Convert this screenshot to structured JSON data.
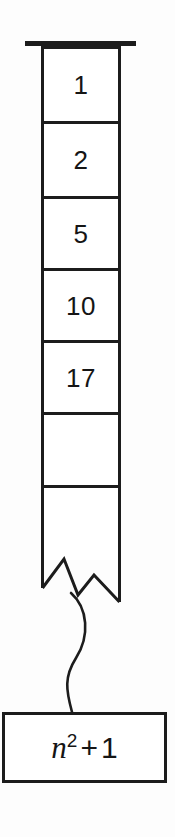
{
  "diagram": {
    "type": "array-cell-diagram",
    "background_color": "#fdfdfd",
    "line_color": "#1c1c1c",
    "text_color": "#151515"
  },
  "array": {
    "name": "vertical-array",
    "cell_count": 7,
    "truncated": true,
    "top_cap": true,
    "cells": [
      {
        "index": 0,
        "value": "1",
        "empty": false
      },
      {
        "index": 1,
        "value": "2",
        "empty": false
      },
      {
        "index": 2,
        "value": "5",
        "empty": false
      },
      {
        "index": 3,
        "value": "10",
        "empty": false
      },
      {
        "index": 4,
        "value": "17",
        "empty": false
      },
      {
        "index": 5,
        "value": "",
        "empty": true
      },
      {
        "index": 6,
        "value": "",
        "empty": true
      }
    ]
  },
  "annotation": {
    "name": "formula-callout",
    "connector": "wavy-curve",
    "formula": {
      "base": "n",
      "exponent": "2",
      "operator": "+",
      "addend": "1",
      "plain_text": "n^2 + 1"
    }
  }
}
